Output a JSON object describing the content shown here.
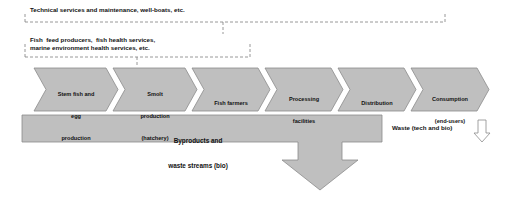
{
  "diagram": {
    "colors": {
      "chevron_fill": "#bfbfbf",
      "chevron_stroke": "#8c8c8c",
      "arrow_fill": "#bfbfbf",
      "arrow_stroke": "#8c8c8c",
      "dashed_stroke": "#7f7f7f",
      "text": "#111111",
      "background": "#ffffff"
    },
    "annotations": [
      {
        "id": "note1",
        "text": "Technical services and maintenance, well-boats, etc.",
        "style": "dashed-bracket"
      },
      {
        "id": "note2",
        "text": "Fish  feed producers,  fish health services,\nmarine environment health services, etc.",
        "style": "dashed-bracket"
      }
    ],
    "stages": [
      {
        "id": "stage-broodstock",
        "line1": "Stem fish and",
        "line2": "egg",
        "line3": "production"
      },
      {
        "id": "stage-smolt",
        "line1": "Smolt",
        "line2": "production",
        "line3": "(hatchery)"
      },
      {
        "id": "stage-farmers",
        "line1": "Fish farmers",
        "line2": "",
        "line3": ""
      },
      {
        "id": "stage-processing",
        "line1": "Processing",
        "line2": "facilities",
        "line3": ""
      },
      {
        "id": "stage-distribution",
        "line1": "Distribution",
        "line2": "",
        "line3": ""
      },
      {
        "id": "stage-consumption",
        "line1": "Consumption",
        "line2": "(end-users)",
        "line3": ""
      }
    ],
    "byproducts": {
      "line1": "Byproducts and",
      "line2": "waste streams (bio)"
    },
    "waste": {
      "label": "Waste (tech and bio)"
    }
  }
}
